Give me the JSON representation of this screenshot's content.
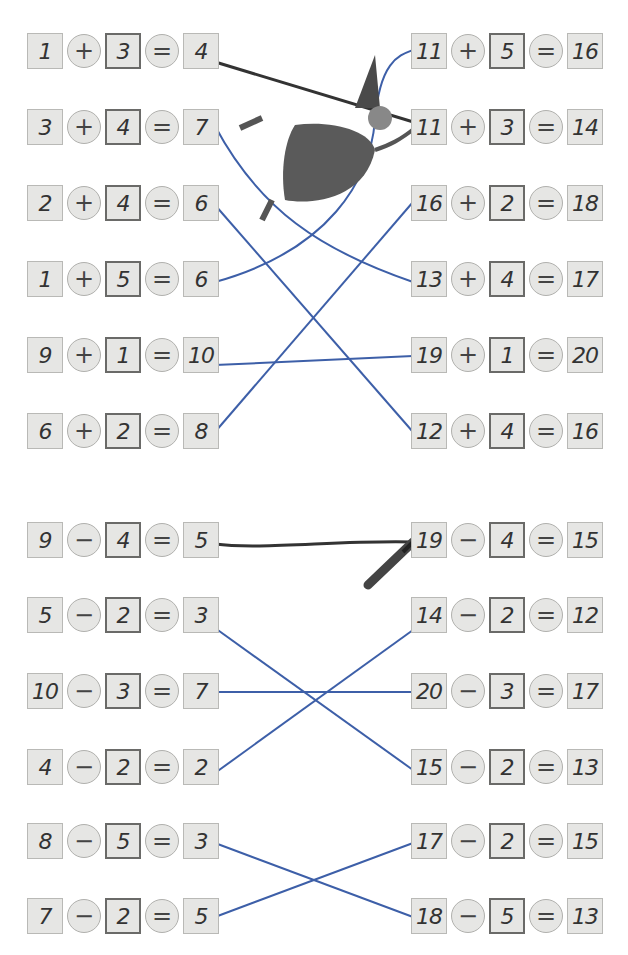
{
  "addition": {
    "left": [
      {
        "a": "1",
        "op": "+",
        "b": "3",
        "eq": "=",
        "r": "4"
      },
      {
        "a": "3",
        "op": "+",
        "b": "4",
        "eq": "=",
        "r": "7"
      },
      {
        "a": "2",
        "op": "+",
        "b": "4",
        "eq": "=",
        "r": "6"
      },
      {
        "a": "1",
        "op": "+",
        "b": "5",
        "eq": "=",
        "r": "6"
      },
      {
        "a": "9",
        "op": "+",
        "b": "1",
        "eq": "=",
        "r": "10"
      },
      {
        "a": "6",
        "op": "+",
        "b": "2",
        "eq": "=",
        "r": "8"
      }
    ],
    "right": [
      {
        "a": "11",
        "op": "+",
        "b": "5",
        "eq": "=",
        "r": "16"
      },
      {
        "a": "11",
        "op": "+",
        "b": "3",
        "eq": "=",
        "r": "14"
      },
      {
        "a": "16",
        "op": "+",
        "b": "2",
        "eq": "=",
        "r": "18"
      },
      {
        "a": "13",
        "op": "+",
        "b": "4",
        "eq": "=",
        "r": "17"
      },
      {
        "a": "19",
        "op": "+",
        "b": "1",
        "eq": "=",
        "r": "20"
      },
      {
        "a": "12",
        "op": "+",
        "b": "4",
        "eq": "=",
        "r": "16"
      }
    ]
  },
  "subtraction": {
    "left": [
      {
        "a": "9",
        "op": "−",
        "b": "4",
        "eq": "=",
        "r": "5"
      },
      {
        "a": "5",
        "op": "−",
        "b": "2",
        "eq": "=",
        "r": "3"
      },
      {
        "a": "10",
        "op": "−",
        "b": "3",
        "eq": "=",
        "r": "7"
      },
      {
        "a": "4",
        "op": "−",
        "b": "2",
        "eq": "=",
        "r": "2"
      },
      {
        "a": "8",
        "op": "−",
        "b": "5",
        "eq": "=",
        "r": "3"
      },
      {
        "a": "7",
        "op": "−",
        "b": "2",
        "eq": "=",
        "r": "5"
      }
    ],
    "right": [
      {
        "a": "19",
        "op": "−",
        "b": "4",
        "eq": "=",
        "r": "15"
      },
      {
        "a": "14",
        "op": "−",
        "b": "2",
        "eq": "=",
        "r": "12"
      },
      {
        "a": "20",
        "op": "−",
        "b": "3",
        "eq": "=",
        "r": "17"
      },
      {
        "a": "15",
        "op": "−",
        "b": "2",
        "eq": "=",
        "r": "13"
      },
      {
        "a": "17",
        "op": "−",
        "b": "2",
        "eq": "=",
        "r": "15"
      },
      {
        "a": "18",
        "op": "−",
        "b": "5",
        "eq": "=",
        "r": "13"
      }
    ]
  },
  "colors": {
    "line": "#3d5fa8",
    "example_line": "#333333"
  }
}
